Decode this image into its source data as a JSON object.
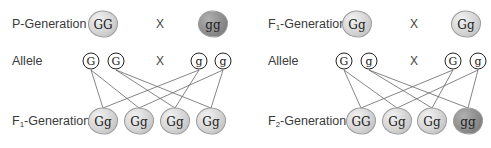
{
  "left_panel": {
    "p_generation": {
      "label": "P-Generation",
      "parent1": "GG",
      "cross": "X",
      "parent2": "gg"
    },
    "alleles": {
      "label": "Allele",
      "items": [
        "G",
        "G",
        "g",
        "g"
      ],
      "cross": "X"
    },
    "f1_generation": {
      "label_main": "F",
      "label_sub": "1",
      "label_rest": "-Generation",
      "offspring": [
        "Gg",
        "Gg",
        "Gg",
        "Gg"
      ]
    }
  },
  "right_panel": {
    "f1_generation": {
      "label_main": "F",
      "label_sub": "1",
      "label_rest": "-Generation",
      "parent1": "Gg",
      "cross": "X",
      "parent2": "Gg"
    },
    "alleles": {
      "label": "Allele",
      "items": [
        "G",
        "g",
        "G",
        "g"
      ],
      "cross": "X"
    },
    "f2_generation": {
      "label_main": "F",
      "label_sub": "2",
      "label_rest": "-Generation",
      "offspring": [
        "GG",
        "Gg",
        "Gg",
        "gg"
      ]
    }
  },
  "colors": {
    "light_blob": "#d4d4d4",
    "dark_blob": "#8a8a8a",
    "line": "#555555"
  }
}
